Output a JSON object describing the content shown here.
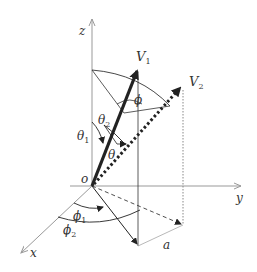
{
  "diagram": {
    "axes": {
      "x_label": "x",
      "y_label": "y",
      "z_label": "z",
      "origin_label": "o"
    },
    "vectors": [
      {
        "name": "V",
        "sub": "1",
        "style": "solid-thick"
      },
      {
        "name": "V",
        "sub": "2",
        "style": "dotted-thick"
      }
    ],
    "angles": {
      "theta1": {
        "sym": "θ",
        "sub": "1"
      },
      "theta2": {
        "sym": "θ",
        "sub": "2"
      },
      "theta": {
        "sym": "θ"
      },
      "phi": {
        "sym": "ϕ"
      },
      "phi1": {
        "sym": "ϕ",
        "sub": "1"
      },
      "phi2": {
        "sym": "ϕ",
        "sub": "2"
      }
    },
    "distance_label": "a",
    "colors": {
      "axis": "#999999",
      "vector": "#222222",
      "guide": "#333333"
    }
  }
}
